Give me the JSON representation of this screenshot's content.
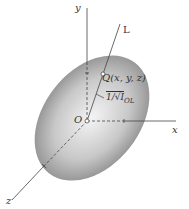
{
  "diagram": {
    "axes": {
      "x": "x",
      "y": "y",
      "z": "z"
    },
    "line_label": "L",
    "origin_label": "O",
    "point_label": "Q(x, y, z)",
    "distance_label": "1/√I",
    "distance_subscript": "OL",
    "colors": {
      "ellipsoid_center": "#f2f2f2",
      "ellipsoid_edge": "#8a8a8a",
      "lines": "#444444"
    }
  }
}
